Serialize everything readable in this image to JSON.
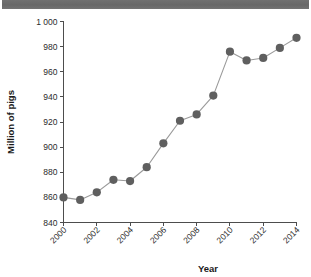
{
  "title_band": {
    "text": ""
  },
  "chart_data": {
    "type": "line",
    "title": "",
    "xlabel": "Year",
    "ylabel": "Million of pigs",
    "x": [
      2000,
      2001,
      2002,
      2003,
      2004,
      2005,
      2006,
      2007,
      2008,
      2009,
      2010,
      2011,
      2012,
      2013,
      2014
    ],
    "values": [
      860,
      858,
      864,
      874,
      873,
      884,
      903,
      921,
      926,
      941,
      976,
      969,
      971,
      979,
      987
    ],
    "series": [
      {
        "name": "Million of pigs",
        "values": [
          860,
          858,
          864,
          874,
          873,
          884,
          903,
          921,
          926,
          941,
          976,
          969,
          971,
          979,
          987
        ]
      }
    ],
    "xlim": [
      2000,
      2014
    ],
    "ylim": [
      840,
      1000
    ],
    "xticks": [
      2000,
      2002,
      2004,
      2006,
      2008,
      2010,
      2012,
      2014
    ],
    "xtick_labels": [
      "2000",
      "2002",
      "2004",
      "2006",
      "2008",
      "2010",
      "2012",
      "2014"
    ],
    "yticks": [
      840,
      860,
      880,
      900,
      920,
      940,
      960,
      980,
      1000
    ],
    "ytick_labels": [
      "840",
      "860",
      "880",
      "900",
      "920",
      "940",
      "960",
      "980",
      "1 000"
    ],
    "grid": false,
    "legend": false,
    "marker": "circle",
    "line_color": "#9a9a9a",
    "marker_color": "#5f5f5f",
    "axis_color": "#4d4d4d"
  }
}
